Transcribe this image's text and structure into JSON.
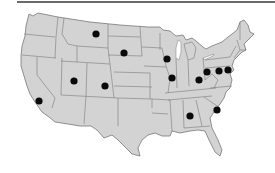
{
  "map": {
    "title": "",
    "region": "Contiguous United States",
    "colors": {
      "land": "#d3d3d3",
      "borders": "#7a7a7a",
      "marker": "#0a0a0a",
      "background": "#ffffff",
      "top_rule": "#6a6a6a"
    },
    "markers": [
      {
        "id": "montana",
        "state": "Montana",
        "x": 96,
        "y": 34
      },
      {
        "id": "south-dakota",
        "state": "South Dakota",
        "x": 124,
        "y": 53
      },
      {
        "id": "utah",
        "state": "Utah",
        "x": 74,
        "y": 81
      },
      {
        "id": "colorado",
        "state": "Colorado",
        "x": 105,
        "y": 86
      },
      {
        "id": "california",
        "state": "California",
        "x": 39,
        "y": 101
      },
      {
        "id": "wisconsin",
        "state": "Wisconsin",
        "x": 167,
        "y": 59
      },
      {
        "id": "illinois",
        "state": "Illinois",
        "x": 172,
        "y": 78
      },
      {
        "id": "kentucky-ohio",
        "state": "Ohio",
        "x": 199,
        "y": 80
      },
      {
        "id": "ohio-east",
        "state": "Ohio",
        "x": 207,
        "y": 72
      },
      {
        "id": "pennsylvania",
        "state": "Pennsylvania",
        "x": 219,
        "y": 71
      },
      {
        "id": "new-jersey",
        "state": "New Jersey",
        "x": 228,
        "y": 70
      },
      {
        "id": "alabama",
        "state": "Alabama",
        "x": 190,
        "y": 116
      },
      {
        "id": "south-carolina",
        "state": "South Carolina",
        "x": 217,
        "y": 110
      }
    ]
  }
}
